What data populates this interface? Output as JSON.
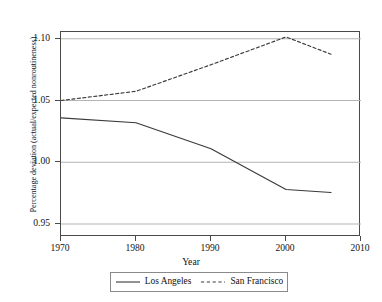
{
  "chart_data": {
    "type": "line",
    "title": "",
    "xlabel": "Year",
    "ylabel": "Percentage deviation (actual/expected nonroutineness)",
    "xlim": [
      1970,
      2010
    ],
    "ylim": [
      0.9395,
      1.1055
    ],
    "xticks": [
      1970,
      1980,
      1990,
      2000,
      2010
    ],
    "xticklabels": [
      "1970",
      "1980",
      "1990",
      "2000",
      "2010"
    ],
    "yticks": [
      0.95,
      1.0,
      1.05,
      1.1
    ],
    "yticklabels": [
      "0.95",
      "1.00",
      "1.05",
      "1.10"
    ],
    "grid": "horizontal",
    "legend_position": "bottom-center",
    "x": [
      1970,
      1980,
      1990,
      2000,
      2006
    ],
    "series": [
      {
        "name": "Los Angeles",
        "style": "solid",
        "color": "#3a3a3a",
        "values": [
          1.036,
          1.032,
          1.011,
          0.978,
          0.9755
        ]
      },
      {
        "name": "San Francisco",
        "style": "dashed",
        "color": "#3a3a3a",
        "values": [
          1.05,
          1.0575,
          1.079,
          1.1015,
          1.0875
        ]
      }
    ]
  },
  "axes": {
    "y_title": "Percentage deviation (actual/expected nonroutineness)",
    "x_title": "Year"
  },
  "legend": {
    "items": [
      {
        "label": "Los Angeles",
        "style": "solid"
      },
      {
        "label": "San Francisco",
        "style": "dashed"
      }
    ]
  }
}
